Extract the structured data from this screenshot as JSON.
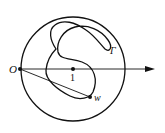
{
  "diagram": {
    "labels": {
      "origin": "O",
      "center": "1",
      "point_w": "w",
      "curve": "Γ"
    },
    "colors": {
      "stroke": "#111111",
      "background": "#ffffff"
    }
  }
}
